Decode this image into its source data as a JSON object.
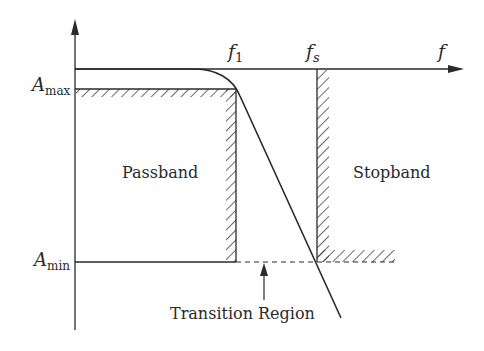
{
  "diagram": {
    "axes": {
      "y_label": "",
      "x_label": "f"
    },
    "labels": {
      "a_max": {
        "main": "A",
        "sub": "max"
      },
      "a_min": {
        "main": "A",
        "sub": "min"
      },
      "f1": {
        "main": "f",
        "sub": "1"
      },
      "fs": {
        "main": "f",
        "sub": "s"
      },
      "f": "f",
      "passband": "Passband",
      "stopband": "Stopband",
      "transition_region": "Transition Region"
    },
    "colors": {
      "stroke": "#2a2a2a",
      "background": "#ffffff"
    }
  }
}
